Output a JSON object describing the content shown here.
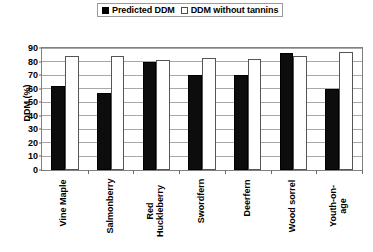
{
  "chart_data": {
    "type": "bar",
    "title": "",
    "xlabel": "",
    "ylabel": "DDM (%)",
    "ylim": [
      0,
      90
    ],
    "yticks": [
      0,
      10,
      20,
      30,
      40,
      50,
      60,
      70,
      80,
      90
    ],
    "grid": true,
    "legend_position": "top-center",
    "categories": [
      "Vine Maple",
      "Salmonberry",
      "Red\nHuckleberry",
      "Swordfern",
      "Deerfern",
      "Wood sorrel",
      "Youth-on-\nage"
    ],
    "series": [
      {
        "name": "Predicted DDM",
        "color": "#000000",
        "style": "filled",
        "values": [
          62,
          57,
          80,
          70,
          70,
          86,
          60
        ]
      },
      {
        "name": "DDM without tannins",
        "color": "#ffffff",
        "style": "open",
        "values": [
          84,
          84,
          81,
          83,
          82,
          84,
          87
        ]
      }
    ]
  },
  "legend": {
    "items": [
      {
        "label": "Predicted DDM",
        "swatch": "filled-square-icon"
      },
      {
        "label": "DDM without tannins",
        "swatch": "open-square-icon"
      }
    ]
  }
}
